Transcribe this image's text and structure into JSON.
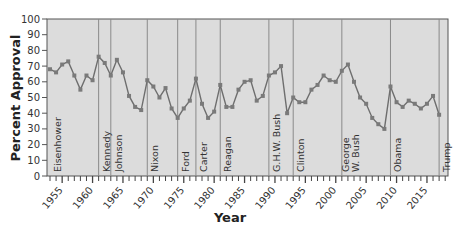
{
  "chart_data": {
    "type": "line",
    "title": "",
    "xlabel": "Year",
    "ylabel": "Percent Approval",
    "ylim": [
      0,
      100
    ],
    "xlim": [
      1953,
      2018
    ],
    "yticks": [
      0,
      10,
      20,
      30,
      40,
      50,
      60,
      70,
      80,
      90,
      100
    ],
    "xticks": [
      "1955",
      "1960",
      "1965",
      "1970",
      "1975",
      "1980",
      "1985",
      "1990",
      "1995",
      "2000",
      "2005",
      "2010",
      "2015"
    ],
    "grid": false,
    "legend": null,
    "background_color": "#dcdcdc",
    "line_color": "#6e6e6e",
    "marker_color": "#7a7a7a",
    "series": [
      {
        "name": "Presidential Approval",
        "x": [
          1953,
          1954,
          1955,
          1956,
          1957,
          1958,
          1959,
          1960,
          1961,
          1962,
          1963,
          1964,
          1965,
          1966,
          1967,
          1968,
          1969,
          1970,
          1971,
          1972,
          1973,
          1974,
          1975,
          1976,
          1977,
          1978,
          1979,
          1980,
          1981,
          1982,
          1983,
          1984,
          1985,
          1986,
          1987,
          1988,
          1989,
          1990,
          1991,
          1992,
          1993,
          1994,
          1995,
          1996,
          1997,
          1998,
          1999,
          2000,
          2001,
          2002,
          2003,
          2004,
          2005,
          2006,
          2007,
          2008,
          2009,
          2010,
          2011,
          2012,
          2013,
          2014,
          2015,
          2016,
          2017
        ],
        "values": [
          68,
          66,
          71,
          73,
          64,
          55,
          64,
          61,
          76,
          72,
          64,
          74,
          66,
          51,
          44,
          42,
          61,
          57,
          50,
          56,
          43,
          37,
          43,
          48,
          62,
          46,
          37,
          41,
          58,
          44,
          44,
          55,
          60,
          61,
          48,
          51,
          64,
          66,
          70,
          40,
          50,
          47,
          47,
          55,
          58,
          64,
          61,
          60,
          67,
          71,
          60,
          50,
          46,
          37,
          33,
          30,
          57,
          47,
          44,
          48,
          46,
          43,
          46,
          51,
          39
        ]
      }
    ],
    "annotations": [
      {
        "label": "Eisenhower",
        "start": 1953,
        "end": 1961
      },
      {
        "label": "Kennedy",
        "start": 1961,
        "end": 1963
      },
      {
        "label": "Johnson",
        "start": 1963,
        "end": 1969
      },
      {
        "label": "Nixon",
        "start": 1969,
        "end": 1974
      },
      {
        "label": "Ford",
        "start": 1974,
        "end": 1977
      },
      {
        "label": "Carter",
        "start": 1977,
        "end": 1981
      },
      {
        "label": "Reagan",
        "start": 1981,
        "end": 1989
      },
      {
        "label": "G.H.W. Bush",
        "start": 1989,
        "end": 1993
      },
      {
        "label": "Clinton",
        "start": 1993,
        "end": 2001
      },
      {
        "label": "George W. Bush",
        "start": 2001,
        "end": 2009
      },
      {
        "label": "Obama",
        "start": 2009,
        "end": 2017
      },
      {
        "label": "Trump",
        "start": 2017,
        "end": 2018
      }
    ]
  }
}
